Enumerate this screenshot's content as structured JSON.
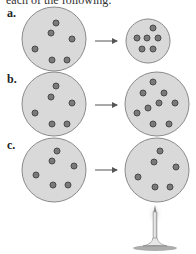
{
  "header": {
    "text": "each of the following:"
  },
  "panels": [
    {
      "label": "a.",
      "description": "Gas particles compressed into smaller container"
    },
    {
      "label": "b.",
      "description": "More gas particles added to same container"
    },
    {
      "label": "c.",
      "description": "Gas heated by burner"
    }
  ],
  "colors": {
    "container_fill": "#d9d9d9",
    "container_stroke": "#8a8a8a",
    "particle_fill": "#7a7a7a",
    "particle_stroke": "#4a4a4a",
    "arrow": "#555555"
  }
}
